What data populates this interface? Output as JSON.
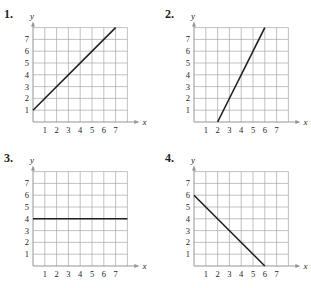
{
  "chart_data": [
    {
      "number": "1.",
      "type": "line",
      "title": "",
      "xlabel": "x",
      "ylabel": "y",
      "x_ticks": [
        "1",
        "2",
        "3",
        "4",
        "5",
        "6",
        "7"
      ],
      "y_ticks": [
        "1",
        "2",
        "3",
        "4",
        "5",
        "6",
        "7"
      ],
      "xlim": [
        0,
        8
      ],
      "ylim": [
        0,
        8
      ],
      "grid": true,
      "series": [
        {
          "name": "line",
          "x": [
            0,
            7
          ],
          "y": [
            1,
            8
          ]
        }
      ]
    },
    {
      "number": "2.",
      "type": "line",
      "title": "",
      "xlabel": "x",
      "ylabel": "y",
      "x_ticks": [
        "1",
        "2",
        "3",
        "4",
        "5",
        "6",
        "7"
      ],
      "y_ticks": [
        "1",
        "2",
        "3",
        "4",
        "5",
        "6",
        "7"
      ],
      "xlim": [
        0,
        8
      ],
      "ylim": [
        0,
        8
      ],
      "grid": true,
      "series": [
        {
          "name": "line",
          "x": [
            2,
            6
          ],
          "y": [
            0,
            8
          ]
        }
      ]
    },
    {
      "number": "3.",
      "type": "line",
      "title": "",
      "xlabel": "x",
      "ylabel": "y",
      "x_ticks": [
        "1",
        "2",
        "3",
        "4",
        "5",
        "6",
        "7"
      ],
      "y_ticks": [
        "1",
        "2",
        "3",
        "4",
        "5",
        "6",
        "7"
      ],
      "xlim": [
        0,
        8
      ],
      "ylim": [
        0,
        8
      ],
      "grid": true,
      "series": [
        {
          "name": "line",
          "x": [
            0,
            8
          ],
          "y": [
            4,
            4
          ]
        }
      ]
    },
    {
      "number": "4.",
      "type": "line",
      "title": "",
      "xlabel": "x",
      "ylabel": "y",
      "x_ticks": [
        "1",
        "2",
        "3",
        "4",
        "5",
        "6",
        "7"
      ],
      "y_ticks": [
        "1",
        "2",
        "3",
        "4",
        "5",
        "6",
        "7"
      ],
      "xlim": [
        0,
        8
      ],
      "ylim": [
        0,
        8
      ],
      "grid": true,
      "series": [
        {
          "name": "line",
          "x": [
            0,
            6
          ],
          "y": [
            6,
            0
          ]
        }
      ]
    }
  ],
  "colors": {
    "grid": "#a7a9ac",
    "axis": "#939598",
    "line": "#231f20",
    "text": "#231f20"
  }
}
